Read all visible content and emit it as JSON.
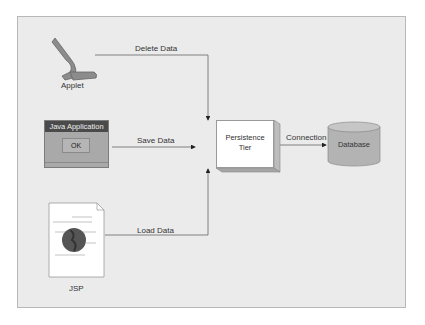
{
  "diagram": {
    "nodes": {
      "applet": {
        "label": "Applet",
        "icon": "applet-icon"
      },
      "java_app": {
        "label": "Java Application",
        "button": "OK"
      },
      "jsp": {
        "label": "JSP",
        "icon": "jsp-document-icon"
      },
      "persistence": {
        "line1": "Persistence",
        "line2": "Tier"
      },
      "database": {
        "label": "Database"
      }
    },
    "edges": {
      "delete": "Delete Data",
      "save": "Save Data",
      "load": "Load Data",
      "connection": "Connection"
    },
    "colors": {
      "background": "#ebebeb",
      "dark": "#4a4a4a",
      "mid": "#a9a9a9",
      "line": "#666666"
    }
  }
}
